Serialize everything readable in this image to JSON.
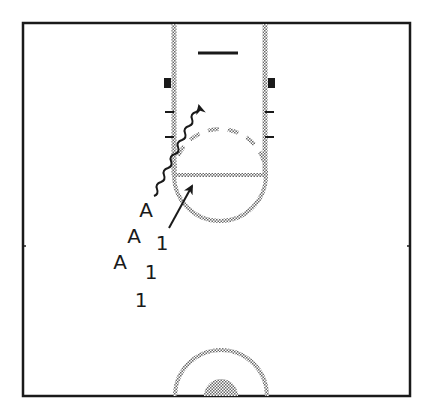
{
  "diagram": {
    "title": "",
    "type": "basketball half-court play diagram",
    "colors": {
      "ink": "#1a1a1a",
      "court_line": "#9a9a9a",
      "background": "#ffffff"
    },
    "court": {
      "boundary": {
        "x1": 22,
        "y1": 22,
        "x2": 411,
        "y2": 397
      },
      "lane": {
        "left_x": 174,
        "right_x": 265,
        "top_y": 22,
        "bottom_y": 175
      },
      "backboard": {
        "x1": 198,
        "x2": 238,
        "y": 53
      },
      "blocks": [
        {
          "side": "left",
          "x": 164,
          "y": 78,
          "w": 7,
          "h": 10
        },
        {
          "side": "right",
          "x": 268,
          "y": 78,
          "w": 7,
          "h": 10
        }
      ],
      "hash_marks": [
        {
          "side": "left",
          "x1": 165,
          "x2": 174,
          "y": 112
        },
        {
          "side": "left",
          "x1": 165,
          "x2": 174,
          "y": 137
        },
        {
          "side": "right",
          "x1": 265,
          "x2": 274,
          "y": 112
        },
        {
          "side": "right",
          "x1": 265,
          "x2": 274,
          "y": 137
        }
      ],
      "free_throw_line": {
        "x1": 174,
        "x2": 265,
        "y": 175
      },
      "free_throw_circle": {
        "cx": 220,
        "cy": 175,
        "r": 46
      },
      "center_circle": {
        "cx": 221,
        "cy": 397,
        "outer_r": 46,
        "inner_r": 17
      }
    },
    "players": [
      {
        "id": "A-1",
        "label": "A",
        "x": 146,
        "y": 210
      },
      {
        "id": "A-2",
        "label": "A",
        "x": 134,
        "y": 236
      },
      {
        "id": "A-3",
        "label": "A",
        "x": 120,
        "y": 262
      },
      {
        "id": "1-1",
        "label": "1",
        "x": 162,
        "y": 243
      },
      {
        "id": "1-2",
        "label": "1",
        "x": 151,
        "y": 272
      },
      {
        "id": "1-3",
        "label": "1",
        "x": 141,
        "y": 300
      }
    ],
    "movements": [
      {
        "type": "dribble",
        "style": "wavy",
        "from": [
          154,
          196
        ],
        "to": [
          201,
          104
        ]
      },
      {
        "type": "cut",
        "style": "straight",
        "from": [
          169,
          228
        ],
        "to": [
          193,
          184
        ]
      }
    ]
  }
}
